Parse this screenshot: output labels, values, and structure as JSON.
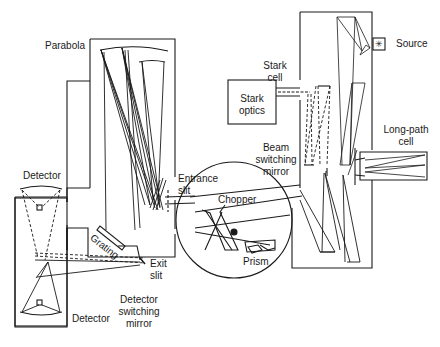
{
  "diagram": {
    "colors": {
      "line": "#1a1a1a",
      "background": "#ffffff"
    },
    "labels": {
      "parabola": "Parabola",
      "source": "Source",
      "stark_cell_1": "Stark",
      "stark_cell_2": "cell",
      "stark_optics_1": "Stark",
      "stark_optics_2": "optics",
      "long_path_1": "Long-path",
      "long_path_2": "cell",
      "beam_switching_1": "Beam",
      "beam_switching_2": "switching",
      "beam_switching_3": "mirror",
      "entrance_1": "Entrance",
      "entrance_2": "slit",
      "chopper": "Chopper",
      "prism": "Prism",
      "detector_top": "Detector",
      "detector_bottom": "Detector",
      "grating": "Grating",
      "exit_1": "Exit",
      "exit_2": "slit",
      "det_switch_1": "Detector",
      "det_switch_2": "switching",
      "det_switch_3": "mirror"
    }
  }
}
